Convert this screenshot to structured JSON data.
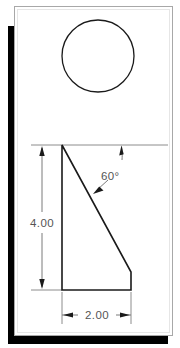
{
  "document": {
    "type": "engineering-drawing",
    "title": "Right triangle profile with circle",
    "page_background": "#ffffff",
    "frame_border_color": "#a8a8a8",
    "shadow_color": "#000000"
  },
  "drawing": {
    "object_line_color": "#1a1a1a",
    "dimension_line_color": "#6b6b6b",
    "extension_line_color": "#8c8c8c",
    "text_color": "#555555",
    "circle": {
      "label": "circle-view",
      "center_x": 98,
      "center_y": 56,
      "radius": 36
    },
    "profile": {
      "label": "triangular-profile",
      "points": "62,145 62,290 131,290 131,272"
    },
    "reference_line": {
      "label": "top-reference-line",
      "x1": 31,
      "y1": 145,
      "x2": 168,
      "y2": 145
    }
  },
  "dimensions": {
    "vertical": {
      "name": "height-dimension",
      "value": "4.00",
      "text_x": 42,
      "text_y": 224,
      "line_x": 42,
      "line_y1": 145,
      "line_y2": 290
    },
    "horizontal": {
      "name": "width-dimension",
      "value": "2.00",
      "text_x": 97,
      "text_y": 319,
      "line_y": 315,
      "line_x1": 62,
      "line_x2": 131
    },
    "angle": {
      "name": "angle-dimension",
      "value": "60°",
      "text_x": 113,
      "text_y": 177,
      "leader_from_x": 93,
      "leader_from_y": 192,
      "leader_to_x": 104,
      "leader_to_y": 183,
      "tick_x": 122,
      "tick_y1": 145,
      "tick_y2": 160
    }
  }
}
